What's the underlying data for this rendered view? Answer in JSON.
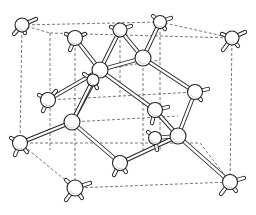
{
  "figure": {
    "colors": {
      "line": "#222222",
      "dashed_edge": "#555555",
      "background": "#ffffff",
      "atom_fill": "#ffffff"
    }
  },
  "cell_corners": {
    "front_top_left": [
      22,
      25
    ],
    "front_top_right": [
      160,
      22
    ],
    "back_top_left": [
      50,
      33
    ],
    "back_top_right": [
      232,
      38
    ],
    "front_bottom_left": [
      20,
      143
    ],
    "front_bottom_right": [
      230,
      182
    ],
    "back_bottom_left": [
      75,
      188
    ],
    "back_bottom_right": [
      158,
      112
    ]
  },
  "cell_edges": [
    [
      [
        22,
        25
      ],
      [
        160,
        22
      ]
    ],
    [
      [
        160,
        22
      ],
      [
        232,
        38
      ]
    ],
    [
      [
        22,
        25
      ],
      [
        50,
        33
      ]
    ],
    [
      [
        50,
        33
      ],
      [
        232,
        38
      ]
    ],
    [
      [
        22,
        25
      ],
      [
        20,
        143
      ]
    ],
    [
      [
        232,
        38
      ],
      [
        230,
        182
      ]
    ],
    [
      [
        20,
        143
      ],
      [
        75,
        188
      ]
    ],
    [
      [
        75,
        188
      ],
      [
        230,
        182
      ]
    ],
    [
      [
        20,
        143
      ],
      [
        200,
        143
      ]
    ],
    [
      [
        200,
        143
      ],
      [
        230,
        182
      ]
    ],
    [
      [
        50,
        33
      ],
      [
        50,
        150
      ]
    ],
    [
      [
        160,
        22
      ],
      [
        160,
        150
      ]
    ],
    [
      [
        75,
        38
      ],
      [
        75,
        188
      ]
    ],
    [
      [
        143,
        58
      ],
      [
        143,
        150
      ]
    ],
    [
      [
        48,
        100
      ],
      [
        195,
        92
      ]
    ],
    [
      [
        72,
        122
      ],
      [
        178,
        116
      ]
    ],
    [
      [
        120,
        30
      ],
      [
        120,
        96
      ]
    ],
    [
      [
        100,
        70
      ],
      [
        160,
        60
      ]
    ]
  ],
  "atoms": [
    {
      "id": "a1",
      "pos": [
        22,
        25
      ],
      "r": 7,
      "stubs": [
        [
          14,
          -6
        ],
        [
          -8,
          9
        ],
        [
          3,
          8
        ]
      ]
    },
    {
      "id": "a2",
      "pos": [
        75,
        38
      ],
      "r": 7.5,
      "stubs": [
        [
          -9,
          -4
        ],
        [
          10,
          -4
        ],
        [
          -5,
          12
        ]
      ]
    },
    {
      "id": "a3",
      "pos": [
        120,
        30
      ],
      "r": 7,
      "stubs": [
        [
          -9,
          -3
        ],
        [
          11,
          -4
        ]
      ]
    },
    {
      "id": "a4",
      "pos": [
        160,
        22
      ],
      "r": 6.5,
      "stubs": [
        [
          -7,
          -6
        ],
        [
          11,
          -4
        ],
        [
          5,
          7
        ]
      ]
    },
    {
      "id": "a5",
      "pos": [
        232,
        38
      ],
      "r": 7,
      "stubs": [
        [
          -10,
          -4
        ],
        [
          13,
          -6
        ],
        [
          -9,
          12
        ],
        [
          6,
          8
        ]
      ]
    },
    {
      "id": "a6",
      "pos": [
        100,
        70
      ],
      "r": 8,
      "stubs": []
    },
    {
      "id": "a7",
      "pos": [
        143,
        58
      ],
      "r": 8,
      "stubs": []
    },
    {
      "id": "a8",
      "pos": [
        48,
        100
      ],
      "r": 7.5,
      "stubs": [
        [
          -9,
          -5
        ],
        [
          -5,
          11
        ],
        [
          8,
          -9
        ]
      ]
    },
    {
      "id": "a9",
      "pos": [
        195,
        92
      ],
      "r": 7.5,
      "stubs": [
        [
          13,
          -3
        ],
        [
          6,
          8
        ]
      ]
    },
    {
      "id": "a10",
      "pos": [
        93,
        80
      ],
      "r": 6,
      "stubs": [
        [
          -9,
          -6
        ],
        [
          4,
          8
        ]
      ]
    },
    {
      "id": "a11",
      "pos": [
        155,
        110
      ],
      "r": 7.5,
      "stubs": [
        [
          13,
          -3
        ],
        [
          -3,
          13
        ]
      ]
    },
    {
      "id": "a12",
      "pos": [
        72,
        122
      ],
      "r": 8,
      "stubs": []
    },
    {
      "id": "a13",
      "pos": [
        20,
        143
      ],
      "r": 7.5,
      "stubs": [
        [
          -9,
          -5
        ],
        [
          -5,
          12
        ],
        [
          7,
          9
        ]
      ]
    },
    {
      "id": "a14",
      "pos": [
        155,
        138
      ],
      "r": 6.5,
      "stubs": [
        [
          -7,
          -6
        ],
        [
          2,
          12
        ]
      ]
    },
    {
      "id": "a15",
      "pos": [
        178,
        136
      ],
      "r": 8,
      "stubs": []
    },
    {
      "id": "a16",
      "pos": [
        120,
        163
      ],
      "r": 7.5,
      "stubs": [
        [
          -6,
          12
        ],
        [
          6,
          9
        ]
      ]
    },
    {
      "id": "a17",
      "pos": [
        75,
        188
      ],
      "r": 8,
      "stubs": [
        [
          -9,
          -8
        ],
        [
          15,
          -5
        ],
        [
          -9,
          12
        ],
        [
          7,
          10
        ]
      ]
    },
    {
      "id": "a18",
      "pos": [
        230,
        182
      ],
      "r": 7.5,
      "stubs": [
        [
          14,
          -4
        ],
        [
          -9,
          12
        ],
        [
          6,
          9
        ]
      ]
    }
  ],
  "bonds": [
    [
      "a2",
      "a6"
    ],
    [
      "a3",
      "a6"
    ],
    [
      "a6",
      "a12"
    ],
    [
      "a6",
      "a8"
    ],
    [
      "a6",
      "a7"
    ],
    [
      "a3",
      "a7"
    ],
    [
      "a4",
      "a7"
    ],
    [
      "a7",
      "a9"
    ],
    [
      "a6",
      "a11"
    ],
    [
      "a10",
      "a12"
    ],
    [
      "a12",
      "a13"
    ],
    [
      "a12",
      "a16"
    ],
    [
      "a9",
      "a15"
    ],
    [
      "a11",
      "a15"
    ],
    [
      "a16",
      "a15"
    ],
    [
      "a15",
      "a18"
    ],
    [
      "a14",
      "a15"
    ]
  ]
}
